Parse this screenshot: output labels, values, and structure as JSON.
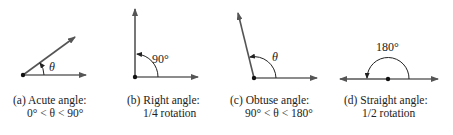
{
  "figures": [
    {
      "id": "a",
      "angle_label": "θ",
      "caption_line1": "(a) Acute angle:",
      "caption_line2": "0° < θ < 90°"
    },
    {
      "id": "b",
      "angle_label": "90°",
      "caption_line1": "(b) Right angle:",
      "caption_line2": "1/4 rotation"
    },
    {
      "id": "c",
      "angle_label": "θ",
      "caption_line1": "(c) Obtuse angle:",
      "caption_line2": "90° < θ < 180°"
    },
    {
      "id": "d",
      "angle_label": "180°",
      "caption_line1": "(d) Straight angle:",
      "caption_line2": "1/2 rotation"
    }
  ],
  "colors": {
    "ray": "#555555",
    "vertex": "#111111",
    "text": "#222222"
  }
}
